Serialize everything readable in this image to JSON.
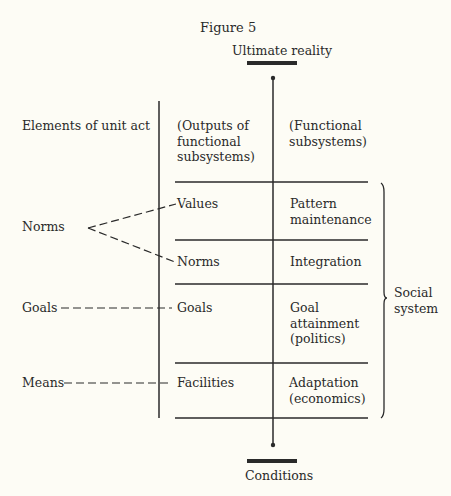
{
  "figure": {
    "title": "Figure 5",
    "top_label": "Ultimate reality",
    "bottom_label": "Conditions",
    "bracket_label": "Social\nsystem"
  },
  "columns": {
    "left_header": "Elements of unit act",
    "middle_header": "(Outputs of\nfunctional\nsubsystems)",
    "right_header": "(Functional\nsubsystems)"
  },
  "unit_act_elements": [
    {
      "label": "Norms"
    },
    {
      "label": "Goals"
    },
    {
      "label": "Means"
    }
  ],
  "rows": [
    {
      "output": "Values",
      "subsystem": "Pattern\nmaintenance"
    },
    {
      "output": "Norms",
      "subsystem": "Integration"
    },
    {
      "output": "Goals",
      "subsystem": "Goal\nattainment\n(politics)"
    },
    {
      "output": "Facilities",
      "subsystem": "Adaptation\n(economics)"
    }
  ],
  "colors": {
    "ink": "#2a2a2a",
    "paper": "#fdfcf5"
  }
}
